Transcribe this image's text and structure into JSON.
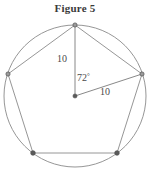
{
  "figure": {
    "title": "Figure 5",
    "caption_position": "top-center"
  },
  "geometry": {
    "shape_name": "regular-pentagon-inscribed-in-circle",
    "circle": {
      "cx": 75,
      "cy": 96,
      "r": 71,
      "stroke": "#8a8a8a",
      "fill": "none"
    },
    "center_point": {
      "x": 75,
      "y": 96,
      "r": 2.1,
      "fill": "#5a5a5a"
    },
    "polygon_stroke": "#8a8a8a",
    "radius_stroke": "#7a7a7a",
    "vertices": [
      {
        "name": "top",
        "x": 75,
        "y": 25
      },
      {
        "name": "right",
        "x": 142,
        "y": 74
      },
      {
        "name": "bottom-right",
        "x": 117,
        "y": 153
      },
      {
        "name": "bottom-left",
        "x": 33,
        "y": 153
      },
      {
        "name": "left",
        "x": 8,
        "y": 74
      }
    ],
    "vertex_marker": {
      "r": 2.1,
      "fill": "#6e6e6e",
      "stroke": "#4f4f4f"
    },
    "radii_drawn": [
      {
        "from": "center",
        "to": "top",
        "label": "10"
      },
      {
        "from": "center",
        "to": "right",
        "label": "10"
      }
    ]
  },
  "labels": {
    "radius_top": "10",
    "radius_right": "10",
    "central_angle_value": "72",
    "central_angle_unit": "°",
    "central_angle_full": "72°"
  },
  "chart_data": {
    "type": "diagram",
    "title": "Figure 5",
    "measurements": [
      {
        "label": "10",
        "kind": "radius",
        "endpoints": [
          "center",
          "top-vertex"
        ]
      },
      {
        "label": "10",
        "kind": "radius",
        "endpoints": [
          "center",
          "right-vertex"
        ]
      },
      {
        "label": "72°",
        "kind": "central-angle",
        "between": [
          "top-vertex",
          "right-vertex"
        ]
      }
    ],
    "sides": 5,
    "radius_value": 10,
    "central_angle": 72
  }
}
